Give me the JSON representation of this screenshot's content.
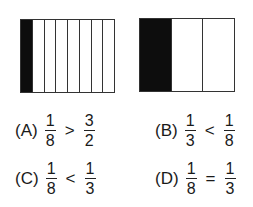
{
  "figures": {
    "left": {
      "parts": 8,
      "shaded": 1
    },
    "right": {
      "parts": 3,
      "shaded": 1
    }
  },
  "options": [
    {
      "label": "(A)",
      "left": {
        "num": "1",
        "den": "8"
      },
      "op": ">",
      "right": {
        "num": "3",
        "den": "2"
      }
    },
    {
      "label": "(B)",
      "left": {
        "num": "1",
        "den": "3"
      },
      "op": "<",
      "right": {
        "num": "1",
        "den": "8"
      }
    },
    {
      "label": "(C)",
      "left": {
        "num": "1",
        "den": "8"
      },
      "op": "<",
      "right": {
        "num": "1",
        "den": "3"
      }
    },
    {
      "label": "(D)",
      "left": {
        "num": "1",
        "den": "8"
      },
      "op": "=",
      "right": {
        "num": "1",
        "den": "3"
      }
    }
  ]
}
